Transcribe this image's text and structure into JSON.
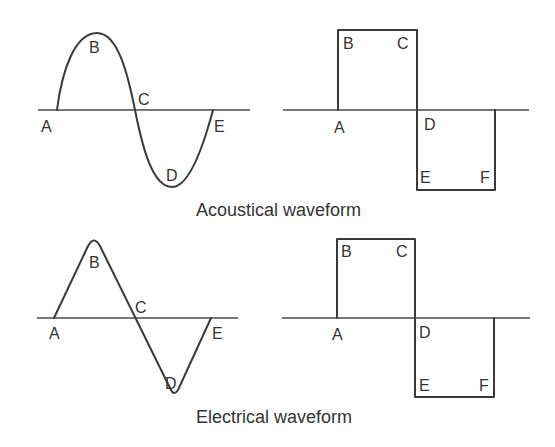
{
  "diagram": {
    "captions": {
      "top": "Acoustical waveform",
      "bottom": "Electrical waveform"
    },
    "panels": [
      {
        "id": "acoustic-sine",
        "labels": [
          "A",
          "B",
          "C",
          "D",
          "E"
        ]
      },
      {
        "id": "acoustic-square",
        "labels": [
          "A",
          "B",
          "C",
          "D",
          "E",
          "F"
        ]
      },
      {
        "id": "electric-triangle",
        "labels": [
          "A",
          "B",
          "C",
          "D",
          "E"
        ]
      },
      {
        "id": "electric-square",
        "labels": [
          "A",
          "B",
          "C",
          "D",
          "E",
          "F"
        ]
      }
    ],
    "colors": {
      "line": "#3a3a3a",
      "text": "#333333",
      "background": "#ffffff"
    }
  }
}
